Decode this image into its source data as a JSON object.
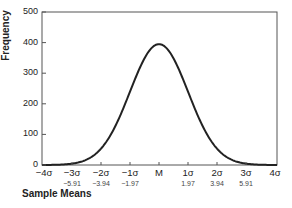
{
  "chart_data": {
    "type": "line",
    "title": "",
    "xlabel": "Sample Means",
    "ylabel": "Frequency",
    "ylim": [
      0,
      500
    ],
    "y_ticks": [
      "0",
      "100",
      "200",
      "300",
      "400",
      "500"
    ],
    "x_ticks": [
      "−4σ",
      "−3σ",
      "−2σ",
      "−1σ",
      "M",
      "1σ",
      "2σ",
      "3σ",
      "4σ"
    ],
    "x_values": [
      "",
      "−5.91",
      "−3.94",
      "−1.97",
      "",
      "1.97",
      "3.94",
      "5.91",
      ""
    ],
    "series": [
      {
        "name": "Normal distribution",
        "x": [
          -4,
          -3,
          -2,
          -1,
          0,
          1,
          2,
          3,
          4
        ],
        "values": [
          0,
          5,
          25,
          150,
          395,
          150,
          25,
          5,
          0
        ]
      }
    ],
    "peak": 395,
    "grid": false,
    "legend": "none"
  }
}
